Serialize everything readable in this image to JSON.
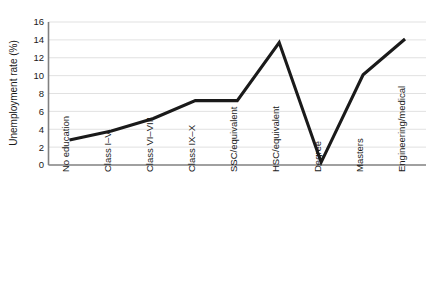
{
  "chart_data": {
    "type": "line",
    "title": "",
    "xlabel": "",
    "ylabel": "Unemployment rate (%)",
    "categories": [
      "No education",
      "Class I–V",
      "Class VI–VIII",
      "Class IX–X",
      "SSC/equivalent",
      "HSC/equivalent",
      "Degree",
      "Masters",
      "Engineering/medical"
    ],
    "values": [
      2.8,
      3.8,
      5.2,
      7.2,
      7.2,
      13.7,
      0.3,
      10.1,
      14.1
    ],
    "ylim": [
      0,
      16
    ],
    "yticks": [
      0,
      2,
      4,
      6,
      8,
      10,
      12,
      14,
      16
    ],
    "ytick_labels": [
      "0",
      "2",
      "4",
      "6",
      "8",
      "10",
      "12",
      "14",
      "16"
    ],
    "grid": true,
    "legend": "none",
    "series_color": "#1a1a1a",
    "grid_color": "#d9d9d9",
    "axis_color": "#808080"
  },
  "axis": {
    "y_title": "Unemployment rate (%)"
  }
}
